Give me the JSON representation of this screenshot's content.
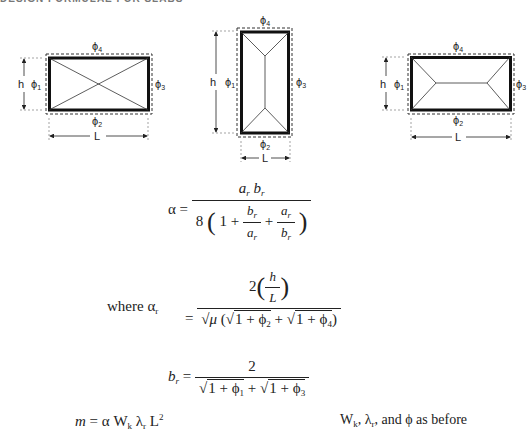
{
  "page": {
    "cutoff_header": "DESIGN FORMULAE FOR SLABS"
  },
  "diagrams": [
    {
      "name": "diagonal-yield-pattern",
      "labels": {
        "top": "4",
        "bottom": "2",
        "left": "1",
        "right": "3",
        "height": "h",
        "length": "L"
      },
      "phi": "ϕ"
    },
    {
      "name": "tall-yield-pattern",
      "labels": {
        "top": "4",
        "bottom": "2",
        "left": "1",
        "right": "3",
        "height": "h",
        "length": "L"
      },
      "phi": "ϕ"
    },
    {
      "name": "wide-yield-pattern",
      "labels": {
        "top": "4",
        "bottom": "2",
        "left": "1",
        "right": "3",
        "height": "h",
        "length": "L"
      },
      "phi": "ϕ"
    }
  ],
  "formulas": {
    "alpha": {
      "lhs": "α =",
      "num_a": "a",
      "num_b": "b",
      "sub": "r",
      "den_8": "8",
      "den_one": "1 +",
      "den_plus": "+"
    },
    "ar": {
      "where_label": "where α",
      "where_sub": "r",
      "eq": "=",
      "num_two": "2",
      "num_h": "h",
      "num_L": "L",
      "den_sqrt_mu": "√μ",
      "den_open": "(",
      "den_sqrt1": "√",
      "den_term1": "1 + ϕ",
      "den_sub1": "2",
      "den_plus": "+",
      "den_term2": "1 + ϕ",
      "den_sub2": "4",
      "den_close": ")"
    },
    "br": {
      "lhs_b": "b",
      "lhs_sub": "r",
      "eq": "=",
      "num": "2",
      "den_term1": "1 + ϕ",
      "den_sub1": "1",
      "den_plus": "+",
      "den_term2": "1 + ϕ",
      "den_sub2": "3"
    },
    "moment": {
      "lhs": "m",
      "rest": "=  α W",
      "w_sub": "k",
      "lambda": " λ",
      "lambda_sub": "r",
      "L": " L",
      "L_sup": "2"
    },
    "note": {
      "w": "W",
      "w_sub": "k",
      "sep1": ", λ",
      "lambda_sub": "r",
      "rest": ", and ϕ as before"
    }
  }
}
